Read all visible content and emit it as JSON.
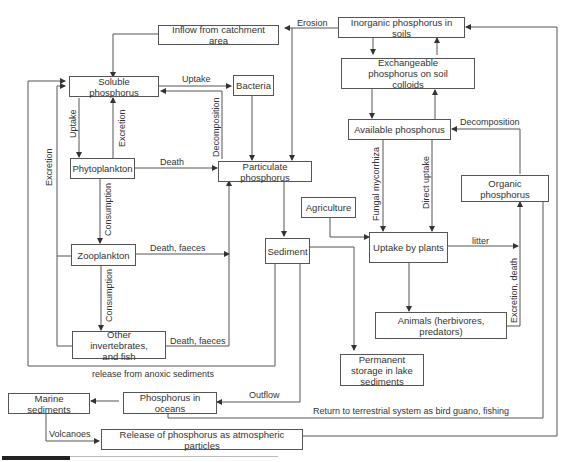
{
  "diagram": {
    "type": "flow-diagram",
    "nodes": {
      "inflow": "Inflow from catchment area",
      "inorganic_soils": "Inorganic phosphorus in soils",
      "soluble": "Soluble phosphorus",
      "bacteria": "Bacteria",
      "exchangeable": "Exchangeable phosphorus on soil colloids",
      "available": "Available phosphorus",
      "phytoplankton": "Phytoplankton",
      "particulate": "Particulate phosphorus",
      "organic": "Organic phosphorus",
      "agriculture": "Agriculture",
      "sediment": "Sediment",
      "uptake_plants": "Uptake by plants",
      "zooplankton": "Zooplankton",
      "animals": "Animals (herbivores, predators)",
      "invertebrates": "Other invertebrates, and fish",
      "permanent": "Permanent storage in lake sediments",
      "marine": "Marine sediments",
      "oceans": "Phosphorus in oceans",
      "atmospheric": "Release of phosphorus as atmospheric particles"
    },
    "edge_labels": {
      "erosion": "Erosion",
      "uptake_bacteria": "Uptake",
      "uptake_phyto": "Uptake",
      "excretion_phyto": "Excretion",
      "excretion_left": "Excretion",
      "decomposition_bacteria": "Decomposition",
      "death": "Death",
      "decomposition_organic": "Decomposition",
      "fungal": "Fungal mycorrhiza",
      "direct_uptake": "Direct uptake",
      "consumption_1": "Consumption",
      "consumption_2": "Consumption",
      "death_faeces_1": "Death, faeces",
      "death_faeces_2": "Death, faeces",
      "litter": "litter",
      "excretion_death": "Excretion, death",
      "anoxic": "release from anoxic sediments",
      "outflow": "Outflow",
      "return": "Return to terrestrial system as bird guano, fishing",
      "volcanoes": "Volcanoes"
    }
  }
}
